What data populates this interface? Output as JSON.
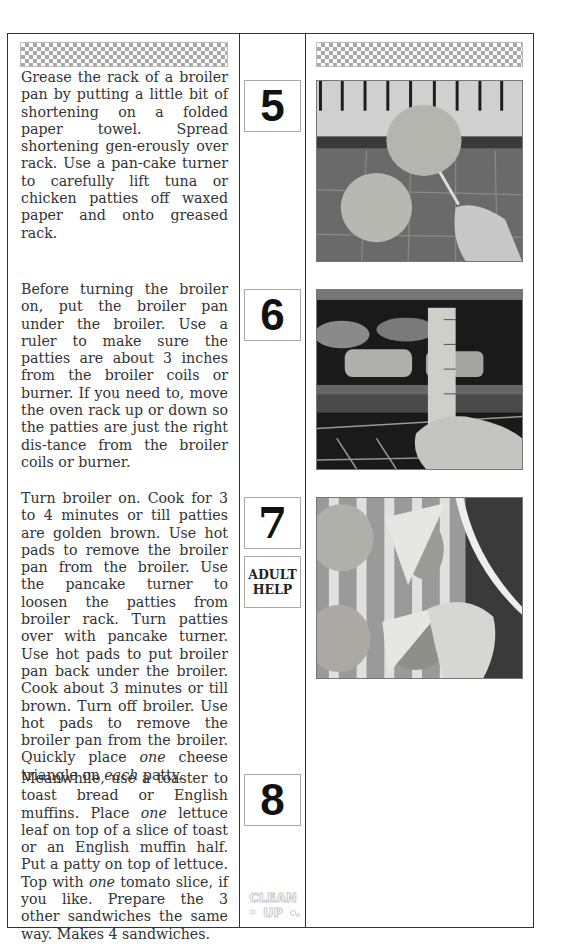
{
  "steps": [
    {
      "number": "5",
      "paragraph_html_parts": [
        "Grease the rack of a broiler pan by putting a little bit of shortening on a folded paper towel. Spread shortening gen-erously over rack. Use a pan-cake turner to carefully lift tuna or chicken patties off waxed paper and onto greased rack."
      ],
      "photo_alt": "Tuna patties being lifted onto greased broiler rack with pancake turner"
    },
    {
      "number": "6",
      "text": "Before turning the broiler on, put the broiler pan under the broiler. Use a ruler to make sure the patties are about 3 inches from the broiler coils or burner. If you need to, move the oven rack up or down so the patties are just the right dis-tance from the broiler coils or burner.",
      "photo_alt": "Ruler held up to measure patties distance from broiler"
    },
    {
      "number": "7",
      "badge_line1": "ADULT",
      "badge_line2": "HELP",
      "text_a": "Turn broiler on. Cook for 3 to 4 minutes or till patties are golden brown. Use hot pads to remove the broiler pan from the broiler. Use the pancake turner to loosen the patties from broiler rack. Turn patties over with pancake turner. Use hot pads to put broiler pan back under the broiler. Cook about 3 minutes or till brown. Turn off broiler. Use hot pads to remove the broiler pan from the broiler. Quickly place ",
      "em_a": "one",
      "text_b": " cheese triangle on ",
      "em_b": "each",
      "text_c": " patty.",
      "photo_alt": "Placing cheese triangles on cooked patties"
    },
    {
      "number": "8",
      "text_a": "Meanwhile, use a toaster to toast bread or English muffins. Place ",
      "em_a": "one",
      "text_b": " lettuce leaf on top of a slice of toast or an English muffin half. Put a patty on top of lettuce. Top with ",
      "em_b": "one",
      "text_c": " tomato slice, if you like. Prepare the 3 other sandwiches the same way. Makes 4 sandwiches."
    }
  ],
  "cleanup_label": "CLEAN UP"
}
